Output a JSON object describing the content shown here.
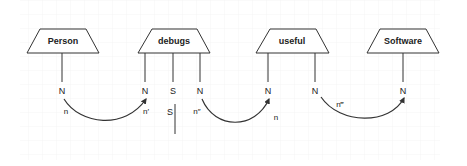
{
  "diagram": {
    "type": "string-diagram",
    "colors": {
      "stroke": "#333333",
      "text": "#222222",
      "grid": "#eeeeee",
      "background": "#ffffff"
    },
    "nodes": [
      {
        "id": "person",
        "label": "Person",
        "shape": "trapezoid",
        "ports": [
          {
            "label": "N",
            "x": 62
          }
        ]
      },
      {
        "id": "debugs",
        "label": "debugs",
        "shape": "trapezoid",
        "ports": [
          {
            "label": "N",
            "x": 145
          },
          {
            "label": "S",
            "x": 173
          },
          {
            "label": "N",
            "x": 200
          }
        ]
      },
      {
        "id": "useful",
        "label": "useful",
        "shape": "trapezoid",
        "ports": [
          {
            "label": "N",
            "x": 268
          },
          {
            "label": "N",
            "x": 315
          }
        ]
      },
      {
        "id": "software",
        "label": "Software",
        "shape": "trapezoid",
        "ports": [
          {
            "label": "N",
            "x": 403
          }
        ]
      }
    ],
    "edges": [
      {
        "from": "person.N",
        "to": "debugs.N",
        "label": "n",
        "end_label": "n′"
      },
      {
        "from": "debugs.N2",
        "to": "useful.N",
        "label": "n″",
        "end_label": "n"
      },
      {
        "from": "useful.N2",
        "to": "software.N",
        "label": "n‴"
      }
    ],
    "open_wire": {
      "label": "S"
    }
  }
}
